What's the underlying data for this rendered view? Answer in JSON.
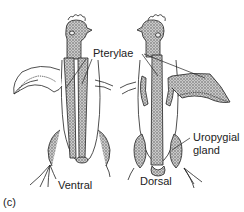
{
  "figure": {
    "panel_label": "(c)",
    "labels": {
      "pterylae": "Pterylae",
      "ventral": "Ventral",
      "dorsal": "Dorsal",
      "uropygial_line1": "Uropygial",
      "uropygial_line2": "gland"
    },
    "colors": {
      "ink": "#222222",
      "stipple": "#8a8a8a",
      "background": "#ffffff"
    }
  }
}
